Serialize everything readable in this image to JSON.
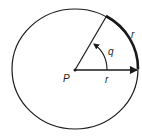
{
  "diagram": {
    "center_label": "P",
    "radius_label": "r",
    "arc_label": "r",
    "angle_label": "q",
    "colors": {
      "stroke": "#1a1a1a",
      "background": "#ffffff"
    }
  }
}
